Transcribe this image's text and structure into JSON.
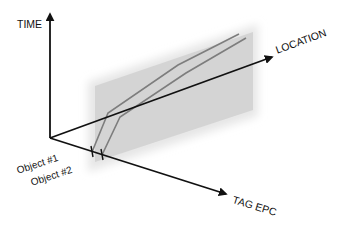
{
  "diagram": {
    "axes": {
      "time": {
        "label": "TIME"
      },
      "location": {
        "label": "LOCATION"
      },
      "tag_epc": {
        "label": "TAG EPC"
      }
    },
    "objects": [
      {
        "label": "Object #1"
      },
      {
        "label": "Object #2"
      }
    ],
    "colors": {
      "axis": "#111111",
      "plane": "#d6d6d6",
      "plane_glow": "#e9e9e9",
      "trajectory": "#7a7a7a"
    }
  }
}
